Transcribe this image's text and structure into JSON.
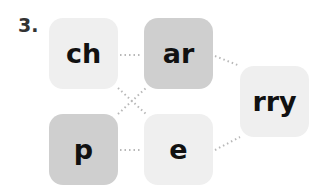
{
  "exercise_number": "3.",
  "tiles": [
    {
      "id": "ch",
      "text": "ch",
      "shade": "light"
    },
    {
      "id": "ar",
      "text": "ar",
      "shade": "dark"
    },
    {
      "id": "p",
      "text": "p",
      "shade": "dark"
    },
    {
      "id": "e",
      "text": "e",
      "shade": "light"
    },
    {
      "id": "rry",
      "text": "rry",
      "shade": "light"
    }
  ],
  "colors": {
    "light": "#efefef",
    "dark": "#cfcfcf",
    "line": "#b8b8b8",
    "text": "#111111"
  }
}
